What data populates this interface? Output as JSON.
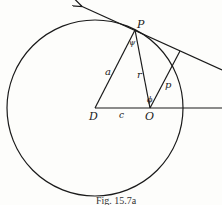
{
  "figure": {
    "caption": "Fig. 15.7a",
    "stroke_color": "#1a1a1a",
    "background": "#fdfdfb"
  },
  "labels": {
    "P": "P",
    "D": "D",
    "O": "O",
    "a": "a",
    "r": "r",
    "c": "c",
    "p": "p",
    "phi_at_P": "ψ",
    "phi_at_O": "ϕ"
  },
  "geometry": {
    "circle": {
      "cx": 95,
      "cy": 108,
      "r": 90
    },
    "points": {
      "P": [
        135,
        30
      ],
      "D": [
        95,
        108
      ],
      "O": [
        150,
        108
      ],
      "foot": [
        180,
        50
      ],
      "arrow_tip": [
        80,
        5
      ],
      "tangent_end": [
        222,
        70
      ],
      "axis_end": [
        222,
        108
      ]
    }
  }
}
